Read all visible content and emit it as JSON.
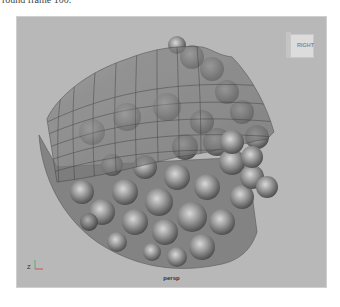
{
  "caption": "round frame 100.",
  "viewport": {
    "camera_name": "persp",
    "viewcube_label": "RIGHT",
    "axis_label": "Z",
    "background_color": "#b8b8b8"
  }
}
